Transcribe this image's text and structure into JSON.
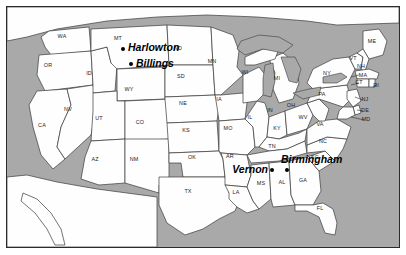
{
  "map": {
    "title": "United States map with marked cities",
    "background_color": "#ffffff",
    "water_color": "#a9a9a9",
    "land_color": "#fefefe",
    "border_color": "#2b2b2b",
    "cities": [
      {
        "name": "Harlowton",
        "dot_x": 123,
        "dot_y": 49,
        "label_x": 128,
        "label_y": 47,
        "anchor": "left"
      },
      {
        "name": "Billings",
        "dot_x": 131,
        "dot_y": 64,
        "label_x": 136,
        "label_y": 63,
        "anchor": "left"
      },
      {
        "name": "Vernon",
        "dot_x": 272,
        "dot_y": 170,
        "label_x": 268,
        "label_y": 169,
        "anchor": "right"
      },
      {
        "name": "Birmingham",
        "dot_x": 287,
        "dot_y": 170,
        "label_x": 281,
        "label_y": 159,
        "anchor": "left"
      }
    ],
    "states": [
      {
        "abbr": "WA",
        "x": 62,
        "y": 36
      },
      {
        "abbr": "OR",
        "x": 48,
        "y": 65
      },
      {
        "abbr": "ID",
        "x": 89,
        "y": 73
      },
      {
        "abbr": "MT",
        "x": 118,
        "y": 38
      },
      {
        "abbr": "ND",
        "x": 178,
        "y": 48
      },
      {
        "abbr": "SD",
        "x": 181,
        "y": 76
      },
      {
        "abbr": "MN",
        "x": 212,
        "y": 61
      },
      {
        "abbr": "WI",
        "x": 245,
        "y": 72
      },
      {
        "abbr": "MI",
        "x": 277,
        "y": 78
      },
      {
        "abbr": "WY",
        "x": 129,
        "y": 89
      },
      {
        "abbr": "NV",
        "x": 68,
        "y": 109
      },
      {
        "abbr": "UT",
        "x": 99,
        "y": 118
      },
      {
        "abbr": "CO",
        "x": 140,
        "y": 122
      },
      {
        "abbr": "NE",
        "x": 183,
        "y": 103
      },
      {
        "abbr": "IA",
        "x": 219,
        "y": 99
      },
      {
        "abbr": "IL",
        "x": 250,
        "y": 117
      },
      {
        "abbr": "IN",
        "x": 270,
        "y": 110
      },
      {
        "abbr": "OH",
        "x": 291,
        "y": 105
      },
      {
        "abbr": "CA",
        "x": 42,
        "y": 125
      },
      {
        "abbr": "AZ",
        "x": 95,
        "y": 159
      },
      {
        "abbr": "NM",
        "x": 134,
        "y": 159
      },
      {
        "abbr": "KS",
        "x": 186,
        "y": 130
      },
      {
        "abbr": "MO",
        "x": 228,
        "y": 128
      },
      {
        "abbr": "KY",
        "x": 277,
        "y": 128
      },
      {
        "abbr": "WV",
        "x": 303,
        "y": 117
      },
      {
        "abbr": "VA",
        "x": 320,
        "y": 124
      },
      {
        "abbr": "OK",
        "x": 192,
        "y": 157
      },
      {
        "abbr": "AR",
        "x": 230,
        "y": 156
      },
      {
        "abbr": "TN",
        "x": 272,
        "y": 146
      },
      {
        "abbr": "NC",
        "x": 323,
        "y": 141
      },
      {
        "abbr": "SC",
        "x": 315,
        "y": 157
      },
      {
        "abbr": "TX",
        "x": 188,
        "y": 191
      },
      {
        "abbr": "LA",
        "x": 236,
        "y": 192
      },
      {
        "abbr": "MS",
        "x": 261,
        "y": 183
      },
      {
        "abbr": "AL",
        "x": 282,
        "y": 182
      },
      {
        "abbr": "GA",
        "x": 303,
        "y": 180
      },
      {
        "abbr": "FL",
        "x": 320,
        "y": 208
      },
      {
        "abbr": "PA",
        "x": 322,
        "y": 94
      },
      {
        "abbr": "NY",
        "x": 327,
        "y": 73
      },
      {
        "abbr": "ME",
        "x": 372,
        "y": 41
      },
      {
        "abbr": "VT",
        "x": 353,
        "y": 58
      },
      {
        "abbr": "NH",
        "x": 361,
        "y": 66
      },
      {
        "abbr": "MA",
        "x": 363,
        "y": 75
      },
      {
        "abbr": "CT",
        "x": 359,
        "y": 82
      },
      {
        "abbr": "RI",
        "x": 376,
        "y": 85
      },
      {
        "abbr": "NJ",
        "x": 365,
        "y": 99
      },
      {
        "abbr": "DE",
        "x": 365,
        "y": 110
      },
      {
        "abbr": "MD",
        "x": 366,
        "y": 119
      }
    ]
  }
}
